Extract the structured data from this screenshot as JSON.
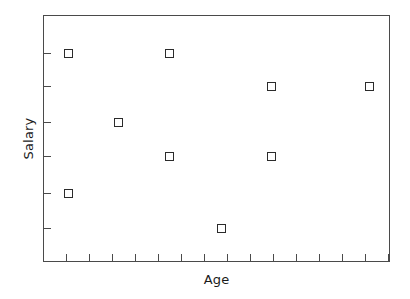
{
  "chart_data": {
    "type": "scatter",
    "title": "",
    "xlabel": "Age",
    "ylabel": "Salary",
    "grid": false,
    "legend": null,
    "marker": "open-square",
    "marker_color": "#2b2b2b",
    "frame_color": "#4a4a4a",
    "background": "#ffffff",
    "xlim": [
      0,
      16
    ],
    "ylim": [
      0,
      7
    ],
    "xticks": [
      1,
      2,
      3,
      4,
      5,
      6,
      7,
      8,
      9,
      10,
      11,
      12,
      13,
      14,
      15
    ],
    "yticks": [
      1,
      2,
      3,
      4,
      5,
      6
    ],
    "xticklabels": [
      "",
      "",
      "",
      "",
      "",
      "",
      "",
      "",
      "",
      "",
      "",
      "",
      "",
      "",
      ""
    ],
    "yticklabels": [
      "",
      "",
      "",
      "",
      "",
      ""
    ],
    "points": [
      {
        "x": 1,
        "y": 6,
        "px": 24,
        "py": 37
      },
      {
        "x": 1,
        "y": 2,
        "px": 24,
        "py": 177
      },
      {
        "x": 3,
        "y": 5,
        "px": 74,
        "py": 106
      },
      {
        "x": 6,
        "y": 6,
        "px": 125,
        "py": 37
      },
      {
        "x": 6,
        "y": 4,
        "px": 125,
        "py": 140
      },
      {
        "x": 8,
        "y": 1,
        "px": 177,
        "py": 212
      },
      {
        "x": 10,
        "y": 5.5,
        "px": 227,
        "py": 70
      },
      {
        "x": 10,
        "y": 4,
        "px": 227,
        "py": 140
      },
      {
        "x": 14,
        "y": 5.5,
        "px": 325,
        "py": 70
      }
    ],
    "xtick_px": [
      22,
      45,
      68,
      91,
      114,
      137,
      160,
      183,
      206,
      229,
      252,
      275,
      298,
      321,
      344
    ],
    "ytick_px": [
      37,
      70,
      106,
      140,
      177,
      212
    ]
  }
}
